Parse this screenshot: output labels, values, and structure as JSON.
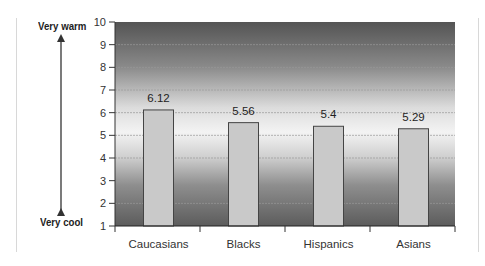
{
  "chart_data": {
    "type": "bar",
    "title": "",
    "xlabel": "",
    "ylabel": "",
    "categories": [
      "Caucasians",
      "Blacks",
      "Hispanics",
      "Asians"
    ],
    "values": [
      6.12,
      5.56,
      5.4,
      5.29
    ],
    "value_labels": [
      "6.12",
      "5.56",
      "5.4",
      "5.29"
    ],
    "ylim": [
      1,
      10
    ],
    "yticks": [
      1,
      2,
      3,
      4,
      5,
      6,
      7,
      8,
      9,
      10
    ],
    "grid": true,
    "legend": null,
    "scale_annotation": {
      "top_label": "Very warm",
      "bottom_label": "Very cool",
      "arrow": "double-headed vertical"
    },
    "colors": {
      "bar_fill": "#c9c9c9",
      "bar_border": "#444444",
      "background_gradient": [
        "#555555",
        "#f4f4f4",
        "#5c5c5c"
      ]
    }
  },
  "scale": {
    "top_label": "Very warm",
    "bottom_label": "Very cool"
  }
}
